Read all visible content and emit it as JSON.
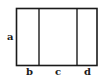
{
  "diagram": {
    "labels": {
      "a": "a",
      "b": "b",
      "c": "c",
      "d": "d"
    },
    "colors": {
      "line": "#1a1a1a",
      "background": "#ffffff"
    }
  }
}
